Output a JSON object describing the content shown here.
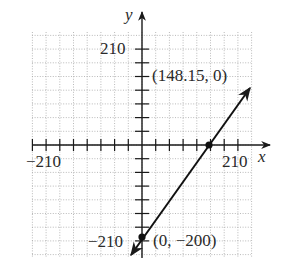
{
  "chart_data": {
    "type": "line",
    "title": "",
    "xlabel": "x",
    "ylabel": "y",
    "xlim": [
      -240,
      270
    ],
    "ylim": [
      -240,
      240
    ],
    "tick_spacing": 30,
    "grid": true,
    "x_tick_labels": [
      "-210",
      "210"
    ],
    "y_tick_labels": [
      "210",
      "-210"
    ],
    "series": [
      {
        "name": "line",
        "equation": "y = (200/148.15)x - 200",
        "x": [
          -7.4,
          148.15,
          240
        ],
        "y": [
          -210,
          0,
          124
        ]
      }
    ],
    "points": [
      {
        "x": 148.15,
        "y": 0,
        "label": "(148.15, 0)"
      },
      {
        "x": 0,
        "y": -200,
        "label": "(0, −200)"
      }
    ]
  },
  "labels": {
    "x_axis": "x",
    "y_axis": "y",
    "x_neg": "−210",
    "x_pos": "210",
    "y_pos": "210",
    "y_neg": "−210",
    "point_a": "(148.15, 0)",
    "point_b": "(0, −200)"
  },
  "colors": {
    "grid": "#9a9a9a",
    "axis": "#1a1a1a",
    "line": "#111111"
  }
}
